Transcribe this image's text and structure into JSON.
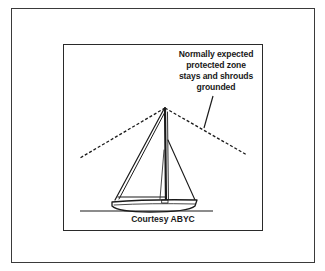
{
  "figure": {
    "callout_lines": [
      "Normally expected",
      "protected zone",
      "stays and shrouds",
      "grounded"
    ],
    "credit": "Courtesy ABYC"
  },
  "colors": {
    "ink": "#1a1a1a",
    "frame": "#3a3a3a",
    "background": "#ffffff"
  }
}
